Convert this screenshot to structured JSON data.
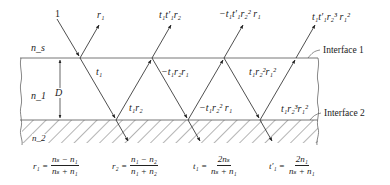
{
  "media": {
    "top_label": "n_s",
    "film_label": "n_1",
    "substrate_label": "n_2",
    "thickness_label": "D"
  },
  "interfaces": [
    {
      "label": "Interface 1"
    },
    {
      "label": "Interface 2"
    }
  ],
  "rays": {
    "incident": "1",
    "reflected": [
      "r₁",
      "t₁t′₁r₂",
      "−t₁t′₁r₂² r₁",
      "t₁t′₁r₂³ r₁²"
    ],
    "internal": [
      "t₁",
      "t₁r₂",
      "−t₁r₂r₁",
      "−t₁r₂² r₁",
      "t₁r₂²r₁²",
      "t₁r₂³r₁²"
    ]
  },
  "formulas": [
    {
      "lhs": "r₁ =",
      "num": "nₛ − n₁",
      "den": "nₛ + n₁"
    },
    {
      "lhs": "r₂ =",
      "num": "n₁ − n₂",
      "den": "n₁ + n₂"
    },
    {
      "lhs": "t₁ =",
      "num": "2nₛ",
      "den": "nₛ + n₁"
    },
    {
      "lhs": "t′₁ =",
      "num": "2n₁",
      "den": "nₛ + n₁"
    }
  ]
}
